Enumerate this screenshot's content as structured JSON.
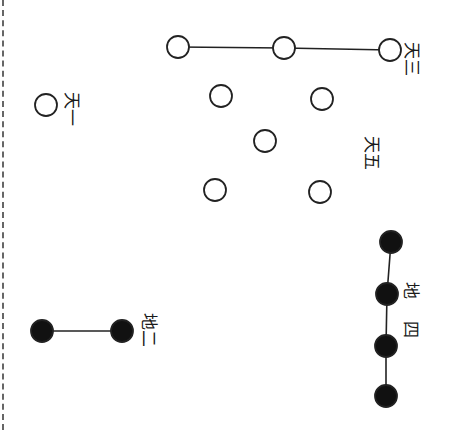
{
  "diagram": {
    "colors": {
      "stroke": "#222222",
      "fill_yin": "#111111",
      "fill_yang": "#ffffff",
      "border": "#666666"
    },
    "groups": [
      {
        "id": "tian-yi",
        "label": "天一",
        "type": "yang",
        "points": [
          [
            46,
            105
          ]
        ],
        "connected": false,
        "label_pos": [
          72,
          103
        ],
        "label_rotate": 90
      },
      {
        "id": "tian-san",
        "label": "天三",
        "type": "yang",
        "points": [
          [
            178,
            47
          ],
          [
            284,
            48
          ],
          [
            390,
            50
          ]
        ],
        "connected": true,
        "label_pos": [
          410,
          52
        ],
        "label_rotate": 90
      },
      {
        "id": "tian-wu",
        "label": "天五",
        "type": "yang",
        "points": [
          [
            221,
            96
          ],
          [
            322,
            99
          ],
          [
            265,
            141
          ],
          [
            215,
            190
          ],
          [
            320,
            192
          ]
        ],
        "connected": false,
        "label_pos": [
          372,
          146
        ],
        "label_rotate": 90
      },
      {
        "id": "di-er",
        "label": "地二",
        "type": "yin",
        "points": [
          [
            42,
            331
          ],
          [
            122,
            331
          ]
        ],
        "connected": true,
        "label_pos": [
          150,
          330
        ],
        "label_rotate": 90
      },
      {
        "id": "di-si",
        "label": "地四",
        "type": "yin",
        "points": [
          [
            391,
            242
          ],
          [
            387,
            294
          ],
          [
            386,
            346
          ],
          [
            386,
            396
          ]
        ],
        "connected": true,
        "label_pos": [
          410,
          320
        ],
        "label_rotate": 90
      }
    ],
    "labels": {
      "tian_yi": "天一",
      "tian_san": "天三",
      "tian_wu": "天五",
      "di_er": "地二",
      "di_si": "地四"
    },
    "circle_radius": 11
  }
}
